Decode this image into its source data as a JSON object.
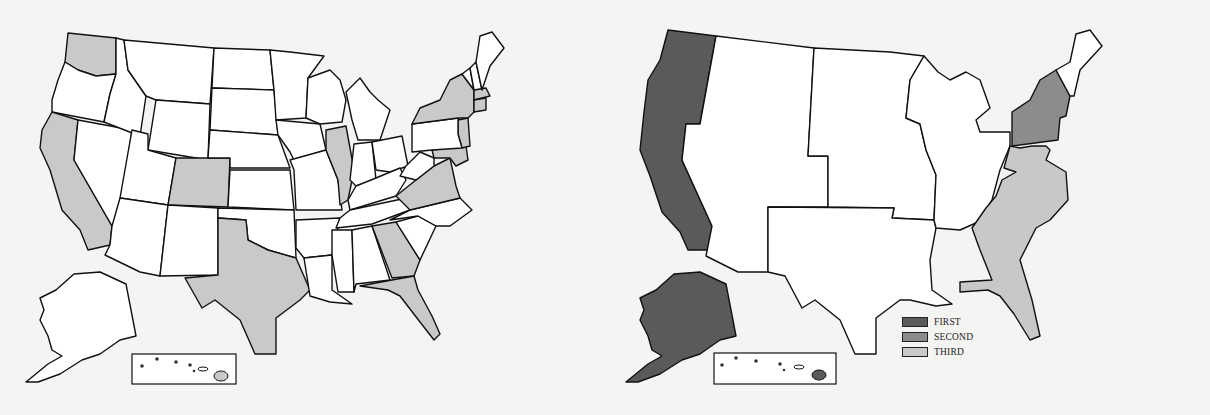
{
  "figure": {
    "left_map": {
      "description": "States shaded (single category)",
      "shade_color": "#c9c9c9",
      "shaded_states": [
        "WA",
        "CA",
        "CO",
        "TX",
        "IL",
        "GA",
        "FL",
        "VA",
        "MD",
        "NJ",
        "NY",
        "MA",
        "CT",
        "HI"
      ]
    },
    "right_map": {
      "regions": [
        {
          "name": "West (WA, OR, CA, AK, HI)",
          "category": "FIRST"
        },
        {
          "name": "Northeast (NY, PA, NJ)",
          "category": "SECOND"
        },
        {
          "name": "Southeast (VA, NC, SC, GA, FL, MD, DE)",
          "category": "THIRD"
        }
      ]
    },
    "legend": {
      "items": [
        {
          "label": "FIRST",
          "color": "#5a5a5a"
        },
        {
          "label": "SECOND",
          "color": "#8c8c8c"
        },
        {
          "label": "THIRD",
          "color": "#c8c8c8"
        }
      ]
    }
  }
}
